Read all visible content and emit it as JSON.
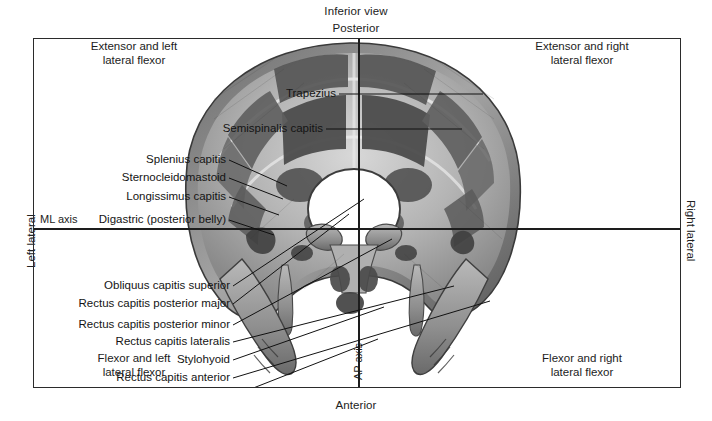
{
  "figure": {
    "view_title": "Inferior view",
    "orientation": {
      "top": "Posterior",
      "bottom": "Anterior",
      "left": "Left lateral",
      "right": "Right lateral"
    },
    "axes": {
      "horizontal_label": "ML axis",
      "vertical_label": "AP axis"
    },
    "quadrants": {
      "top_left": "Extensor and left\nlateral flexor",
      "top_right": "Extensor and right\nlateral flexor",
      "bottom_left": "Flexor and left\nlateral flexor",
      "bottom_right": "Flexor and right\nlateral flexor"
    },
    "colors": {
      "frame": "#2b2b2b",
      "axis": "#1d1d1d",
      "text": "#141414",
      "bone_light": "#c9c9c9",
      "bone_mid": "#9b9b9b",
      "attachment_dark": "#4e4e4e",
      "background": "#ffffff"
    }
  },
  "labels": [
    {
      "id": "trapezius",
      "text": "Trapezius",
      "x": 271,
      "y": 55,
      "anchor_x": 302,
      "anchor_y": 55,
      "target_x": 449,
      "target_y": 55
    },
    {
      "id": "semispinalis-capitis",
      "text": "Semispinalis capitis",
      "x": 258,
      "y": 90,
      "anchor_x": 289,
      "anchor_y": 90,
      "target_x": 428,
      "target_y": 90
    },
    {
      "id": "splenius-capitis",
      "text": "Splenius capitis",
      "x": 177,
      "y": 121,
      "anchor_x": 192,
      "anchor_y": 121,
      "target_x": 253,
      "target_y": 147
    },
    {
      "id": "sternocleidomastoid",
      "text": "Sternocleidomastoid",
      "x": 177,
      "y": 139,
      "anchor_x": 192,
      "anchor_y": 139,
      "target_x": 249,
      "target_y": 160
    },
    {
      "id": "longissimus-capitis",
      "text": "Longissimus capitis",
      "x": 177,
      "y": 158,
      "anchor_x": 192,
      "anchor_y": 158,
      "target_x": 245,
      "target_y": 176
    },
    {
      "id": "digastric-posterior-belly",
      "text": "Digastric (posterior belly)",
      "x": 177,
      "y": 181,
      "anchor_x": 192,
      "anchor_y": 181,
      "target_x": 240,
      "target_y": 196
    },
    {
      "id": "obliquus-capitis-superior",
      "text": "Obliquus capitis superior",
      "x": 183,
      "y": 247,
      "anchor_x": 196,
      "anchor_y": 247,
      "target_x": 330,
      "target_y": 160
    },
    {
      "id": "rectus-capitis-posterior-major",
      "text": "Rectus capitis posterior major",
      "x": 183,
      "y": 265,
      "anchor_x": 196,
      "anchor_y": 265,
      "target_x": 315,
      "target_y": 175
    },
    {
      "id": "rectus-capitis-posterior-minor",
      "text": "Rectus capitis posterior minor",
      "x": 183,
      "y": 286,
      "anchor_x": 196,
      "anchor_y": 286,
      "target_x": 358,
      "target_y": 200
    },
    {
      "id": "rectus-capitis-lateralis",
      "text": "Rectus capitis lateralis",
      "x": 183,
      "y": 303,
      "anchor_x": 196,
      "anchor_y": 303,
      "target_x": 420,
      "target_y": 247
    },
    {
      "id": "stylohyoid",
      "text": "Stylohyoid",
      "x": 183,
      "y": 321,
      "anchor_x": 196,
      "anchor_y": 321,
      "target_x": 350,
      "target_y": 268
    },
    {
      "id": "rectus-capitis-anterior",
      "text": "Rectus capitis anterior",
      "x": 183,
      "y": 339,
      "anchor_x": 196,
      "anchor_y": 339,
      "target_x": 456,
      "target_y": 262
    },
    {
      "id": "longus-capitis",
      "text": "Longus capitis",
      "x": 183,
      "y": 357,
      "anchor_x": 196,
      "anchor_y": 357,
      "target_x": 344,
      "target_y": 300
    }
  ],
  "chart_data": {
    "type": "scatter",
    "title": "Inferior view",
    "xlabel": "ML axis",
    "ylabel": "AP axis",
    "quadrant_names": [
      "Extensor and left lateral flexor",
      "Extensor and right lateral flexor",
      "Flexor and left lateral flexor",
      "Flexor and right lateral flexor"
    ],
    "annotations": [
      "Trapezius",
      "Semispinalis capitis",
      "Splenius capitis",
      "Sternocleidomastoid",
      "Longissimus capitis",
      "Digastric (posterior belly)",
      "Obliquus capitis superior",
      "Rectus capitis posterior major",
      "Rectus capitis posterior minor",
      "Rectus capitis lateralis",
      "Stylohyoid",
      "Rectus capitis anterior",
      "Longus capitis"
    ]
  }
}
